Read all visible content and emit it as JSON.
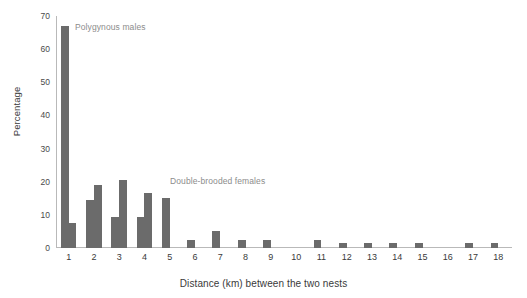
{
  "chart_data": {
    "type": "bar",
    "title": "",
    "subtitle": "",
    "xlabel": "Distance (km) between the two nests",
    "ylabel": "Percentage",
    "categories": [
      "1",
      "2",
      "3",
      "4",
      "5",
      "6",
      "7",
      "8",
      "9",
      "10",
      "11",
      "12",
      "13",
      "14",
      "15",
      "16",
      "17",
      "18"
    ],
    "series": [
      {
        "name": "Polygynous males",
        "color": "#6b6b6b",
        "values": [
          67,
          14.5,
          9.5,
          9.5,
          15,
          2.5,
          5,
          2.5,
          2.5,
          0,
          2.5,
          1.5,
          1.5,
          1.5,
          1.5,
          0,
          1.5,
          1.5
        ]
      },
      {
        "name": "Double-brooded females",
        "color": "#6b6b6b",
        "values": [
          7.5,
          19,
          20.5,
          16.5,
          0,
          0,
          0,
          0,
          0,
          0,
          0,
          0,
          0,
          0,
          0,
          0,
          0,
          0
        ]
      }
    ],
    "ylim": [
      0,
      70
    ],
    "yticks": [
      "0",
      "10",
      "20",
      "30",
      "40",
      "50",
      "60",
      "70"
    ],
    "ytick_values": [
      0,
      10,
      20,
      30,
      40,
      50,
      60,
      70
    ],
    "grid": false,
    "legend_position": "in-plot-annotations",
    "annotations": [
      {
        "text": "Polygynous males",
        "x": 1,
        "y": 63
      },
      {
        "text": "Double-brooded females",
        "x": 7,
        "y": 22
      }
    ],
    "axis_color": "#b9b9b9",
    "text_color": "#3a3a3a",
    "annotation_color": "#8c8c8c",
    "background": "#ffffff"
  }
}
